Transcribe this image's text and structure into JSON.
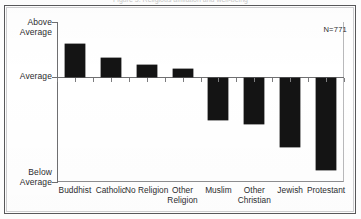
{
  "figure": {
    "title_remnant": "Figure 3. Religious affiliation and well-being",
    "annotation": "N=771"
  },
  "chart_data": {
    "type": "bar",
    "title": "",
    "xlabel": "",
    "ylabel": "",
    "orientation": "vertical",
    "grid": false,
    "legend": false,
    "baseline_label": "Average",
    "categories": [
      "Buddhist",
      "Catholic",
      "No Religion",
      "Other\nReligion",
      "Muslim",
      "Other\nChristian",
      "Jewish",
      "Protestant"
    ],
    "values": [
      0.6,
      0.35,
      0.22,
      0.15,
      -0.76,
      -0.84,
      -1.25,
      -1.67
    ],
    "ylim": [
      -1.91,
      1.0
    ],
    "ytick_values": [
      1.0,
      0.0,
      -1.91
    ],
    "ytick_labels": [
      "Above\nAverage",
      "Average",
      "Below\nAverage"
    ],
    "bar_color": "#141414",
    "axis_color": "#6f6f71"
  },
  "axis": {
    "y_labels": [
      {
        "text": "Above\nAverage"
      },
      {
        "text": "Average"
      },
      {
        "text": "Below\nAverage"
      }
    ]
  }
}
